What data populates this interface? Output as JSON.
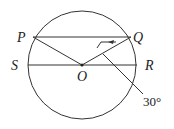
{
  "diagram": {
    "points": {
      "P": "P",
      "Q": "Q",
      "S": "S",
      "R": "R",
      "O": "O"
    },
    "angle_label": "30°",
    "stroke_color": "#333333"
  }
}
